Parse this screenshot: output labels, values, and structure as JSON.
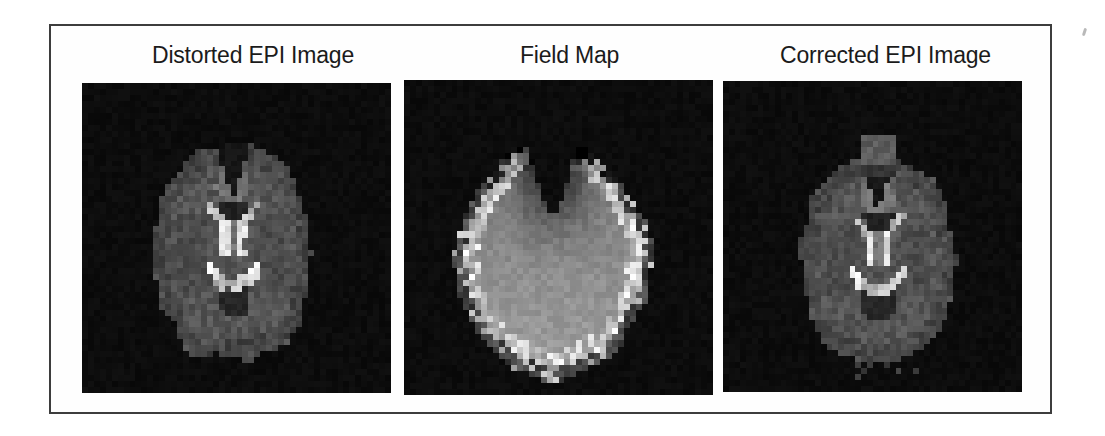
{
  "figure": {
    "background": "#ffffff",
    "border_color": "#3d3d3d",
    "title_color": "#1b1b1b",
    "panel_bg": "#0a0a0a",
    "panels": [
      {
        "title": "Distorted EPI Image",
        "render": "epi_distorted",
        "depicts": "axial grayscale EPI brain slice with bright ventricles, distorted bumpy outline"
      },
      {
        "title": "Field Map",
        "render": "field_map",
        "depicts": "smooth light-gray oval field map with dark frontal shading and bright speckled rim"
      },
      {
        "title": "Corrected EPI Image",
        "render": "epi_corrected",
        "depicts": "axial grayscale EPI brain slice with bright ventricles, smoother corrected outline"
      }
    ],
    "image_colors": {
      "epi_tissue": "#4f4f4f",
      "epi_ventricle_bright": "#ededed",
      "epi_fissure_dark": "#141414",
      "fieldmap_interior": "#8d8d8d",
      "fieldmap_rim": "#f0f0f0",
      "fieldmap_top_shadow": "#141414"
    }
  }
}
